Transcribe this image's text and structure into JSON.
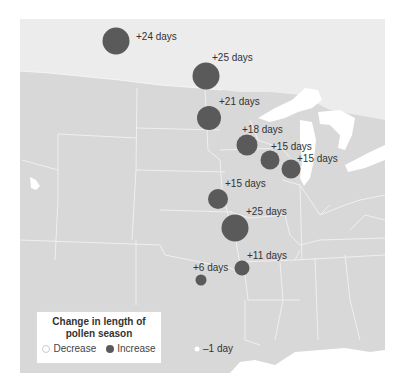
{
  "colors": {
    "canada": "#ececec",
    "usa": "#d8d8d8",
    "water": "#ffffff",
    "border": "#f7f7f7",
    "increase": "#5a5a5a",
    "decrease": "#ffffff",
    "label": "#333333"
  },
  "legend": {
    "title_line1": "Change in length of",
    "title_line2": "pollen season",
    "decrease_label": "Decrease",
    "increase_label": "Increase"
  },
  "locations": [
    {
      "label": "+24 days",
      "value": 24,
      "type": "increase"
    },
    {
      "label": "+25 days",
      "value": 25,
      "type": "increase"
    },
    {
      "label": "+21 days",
      "value": 21,
      "type": "increase"
    },
    {
      "label": "+18 days",
      "value": 18,
      "type": "increase"
    },
    {
      "label": "+15 days",
      "value": 15,
      "type": "increase"
    },
    {
      "label": "+15 days",
      "value": 15,
      "type": "increase"
    },
    {
      "label": "+15 days",
      "value": 15,
      "type": "increase"
    },
    {
      "label": "+25 days",
      "value": 25,
      "type": "increase"
    },
    {
      "label": "+11 days",
      "value": 11,
      "type": "increase"
    },
    {
      "label": "+6 days",
      "value": 6,
      "type": "increase"
    },
    {
      "label": "–1 day",
      "value": -1,
      "type": "decrease"
    }
  ]
}
